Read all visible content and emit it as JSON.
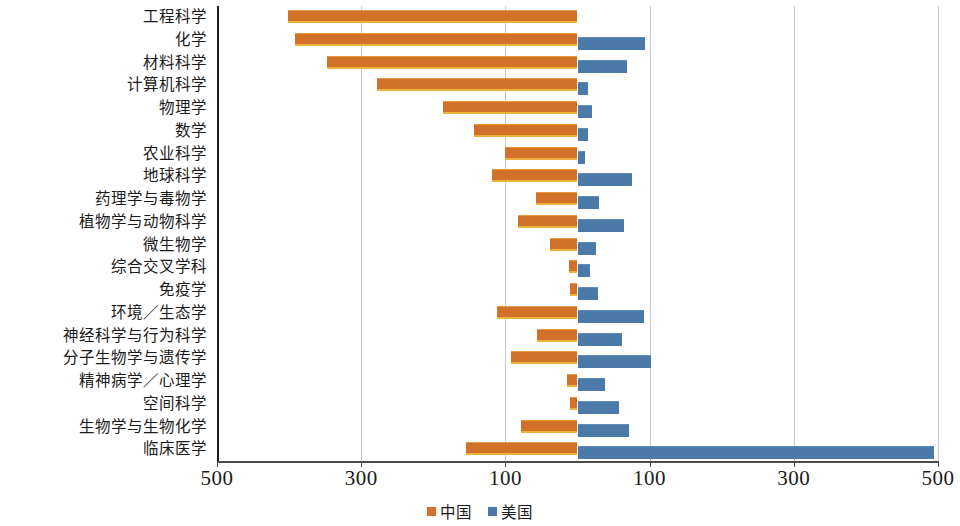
{
  "chart_data": {
    "type": "bar",
    "orientation": "horizontal-diverging",
    "title": "",
    "subtitle": "",
    "xlabel": "",
    "ylabel": "",
    "xlim": [
      -500,
      500
    ],
    "xticks": [
      500,
      300,
      100,
      100,
      300,
      500
    ],
    "xtick_labels": [
      "500",
      "300",
      "100",
      "100",
      "300",
      "500"
    ],
    "grid": true,
    "legend_position": "bottom-center",
    "note": "Left side (orange) = 中国; right side (blue) = 美国. Values are magnitudes.",
    "categories": [
      "工程科学",
      "化学",
      "材料科学",
      "计算机科学",
      "物理学",
      "数学",
      "农业科学",
      "地球科学",
      "药理学与毒物学",
      "植物学与动物科学",
      "微生物学",
      "综合交叉学科",
      "免疫学",
      "环境／生态学",
      "神经科学与行为科学",
      "分子生物学与遗传学",
      "精神病学／心理学",
      "空间科学",
      "生物学与生物化学",
      "临床医学"
    ],
    "series": [
      {
        "name": "中国",
        "color": "#d2712a",
        "direction": "left",
        "values": [
          402,
          392,
          348,
          278,
          186,
          144,
          100,
          118,
          58,
          82,
          38,
          12,
          10,
          112,
          56,
          92,
          14,
          10,
          78,
          154
        ]
      },
      {
        "name": "美国",
        "color": "#4b7aa8",
        "direction": "right",
        "values": [
          0,
          94,
          68,
          14,
          20,
          14,
          10,
          76,
          30,
          64,
          26,
          18,
          28,
          92,
          62,
          102,
          38,
          58,
          72,
          495
        ]
      }
    ]
  },
  "legend": {
    "items": [
      {
        "label": "中国",
        "swatch": "orange-swatch"
      },
      {
        "label": "美国",
        "swatch": "blue-swatch"
      }
    ]
  },
  "colors": {
    "china": "#d2712a",
    "china_edge": "#edb23c",
    "usa": "#4b7aa8",
    "gridline": "#c9c9c9",
    "axis": "#1c1c1c",
    "text": "#1a1a1a",
    "background": "#ffffff"
  }
}
